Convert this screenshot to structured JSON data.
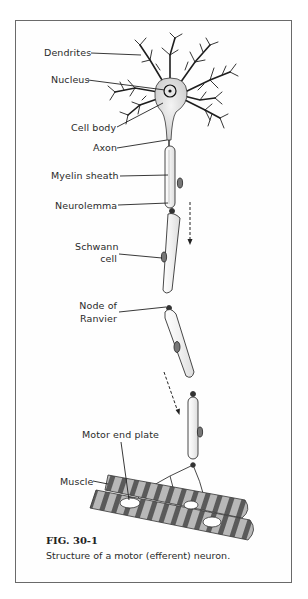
{
  "figure": {
    "number": "FIG. 30-1",
    "caption": "Structure of a motor (efferent) neuron."
  },
  "labels": {
    "dendrites": "Dendrites",
    "nucleus": "Nucleus",
    "cell_body": "Cell body",
    "axon": "Axon",
    "myelin_sheath": "Myelin sheath",
    "neurolemma": "Neurolemma",
    "schwann_line1": "Schwann",
    "schwann_line2": "cell",
    "node_line1": "Node of",
    "node_line2": "Ranvier",
    "motor_end_plate": "Motor end plate",
    "muscle": "Muscle"
  },
  "colors": {
    "ink": "#222222",
    "border": "#6a6a6a",
    "muscle_band_dark": "#555555",
    "muscle_band_light": "#b5b5b5"
  }
}
